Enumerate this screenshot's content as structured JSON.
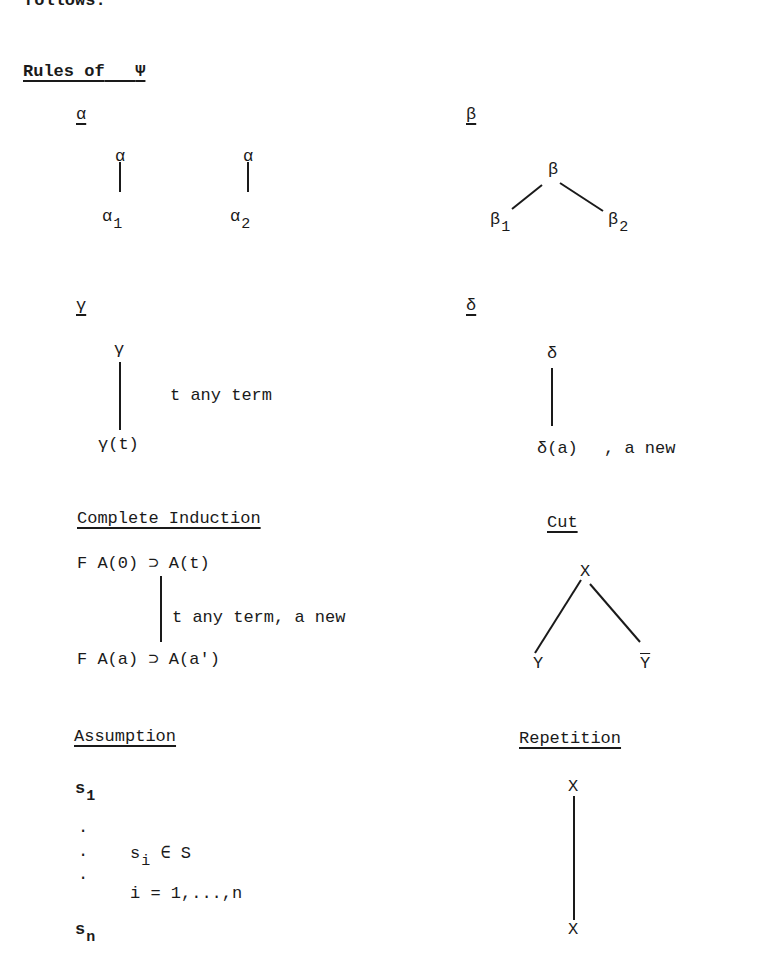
{
  "page": {
    "top_partial_text": "follows:",
    "heading": "Rules of",
    "heading_symbol": "Ψ"
  },
  "rules": {
    "alpha": {
      "label": "α",
      "left": {
        "top": "α",
        "bottom": "α",
        "bottom_sub": "1"
      },
      "right": {
        "top": "α",
        "bottom": "α",
        "bottom_sub": "2"
      }
    },
    "beta": {
      "label": "β",
      "top": "β",
      "left": "β",
      "left_sub": "1",
      "right": "β",
      "right_sub": "2"
    },
    "gamma": {
      "label": "γ",
      "top": "γ",
      "bottom": "γ(t)",
      "note": "t  any term"
    },
    "delta": {
      "label": "δ",
      "top": "δ",
      "bottom": "δ(a)",
      "note": ",  a new"
    },
    "complete_induction": {
      "label": "Complete Induction",
      "top": "F A(0) ⊃ A(t)",
      "note": "t  any term, a new",
      "bottom": "F A(a) ⊃ A(a')"
    },
    "cut": {
      "label": "Cut",
      "top": "X",
      "left": "Y",
      "right": "Y"
    },
    "assumption": {
      "label": "Assumption",
      "first": "s",
      "first_sub": "1",
      "dots": [
        "·",
        "·",
        "·"
      ],
      "cond1": "s",
      "cond1_sub": "i",
      "cond1_rest": " ∈ S",
      "cond2": "i = 1,...,n",
      "last": "s",
      "last_sub": "n"
    },
    "repetition": {
      "label": "Repetition",
      "top": "X",
      "bottom": "X"
    }
  }
}
